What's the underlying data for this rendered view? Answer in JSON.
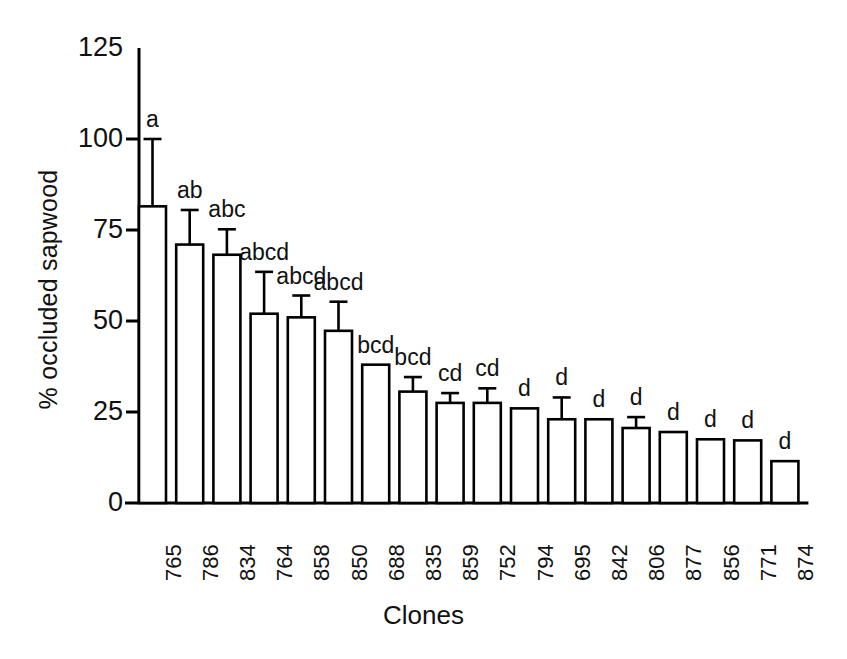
{
  "chart_data": {
    "type": "bar",
    "title": "",
    "subtitle": "",
    "xlabel": "Clones",
    "ylabel": "% occluded sapwood",
    "categories": [
      "765",
      "786",
      "834",
      "764",
      "858",
      "850",
      "688",
      "835",
      "859",
      "752",
      "794",
      "695",
      "842",
      "806",
      "877",
      "856",
      "771",
      "874"
    ],
    "values": [
      81.5,
      71.0,
      68.2,
      52.0,
      51.0,
      47.3,
      38.0,
      30.6,
      27.5,
      27.5,
      26.0,
      23.0,
      23.0,
      20.6,
      19.5,
      17.5,
      17.2,
      11.5
    ],
    "errors": [
      18.5,
      9.5,
      7.0,
      11.5,
      6.0,
      8.0,
      0,
      4.0,
      2.7,
      4.0,
      0,
      6.0,
      0,
      3.0,
      0,
      0,
      0,
      0
    ],
    "error_type": "upper-only",
    "annotations": [
      "a",
      "ab",
      "abc",
      "abcd",
      "abcd",
      "abcd",
      "bcd",
      "bcd",
      "cd",
      "cd",
      "d",
      "d",
      "d",
      "d",
      "d",
      "d",
      "d",
      "d"
    ],
    "yticks": [
      0,
      25,
      50,
      75,
      100,
      125
    ],
    "ytick_labels": [
      "0",
      "25",
      "50",
      "75",
      "100",
      "125"
    ],
    "ylim": [
      0,
      125
    ],
    "grid": false,
    "legend": null,
    "bar_fill": "#ffffff",
    "bar_stroke": "#000000",
    "axis_color": "#000000",
    "background": "#ffffff"
  },
  "axes": {
    "y_title": "% occluded sapwood",
    "x_title": "Clones"
  }
}
